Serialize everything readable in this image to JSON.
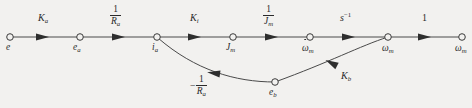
{
  "figure": {
    "type": "signal-flow-graph",
    "title": "",
    "background_color": "#f2f1ef",
    "line_color": "#3a3a3a"
  },
  "nodes": [
    {
      "id": "e",
      "label": "e",
      "sub": "",
      "dot": false,
      "x": 10,
      "y": 37,
      "label_x": 6,
      "label_y": 47
    },
    {
      "id": "e_a",
      "label": "e",
      "sub": "a",
      "dot": false,
      "x": 80,
      "y": 37,
      "label_x": 74,
      "label_y": 47
    },
    {
      "id": "i_a",
      "label": "i",
      "sub": "a",
      "dot": false,
      "x": 157,
      "y": 37,
      "label_x": 153,
      "label_y": 47
    },
    {
      "id": "J_m",
      "label": "J",
      "sub": "m",
      "dot": false,
      "x": 233,
      "y": 37,
      "label_x": 227,
      "label_y": 47
    },
    {
      "id": "wdot_m",
      "label": "ω",
      "sub": "m",
      "dot": true,
      "x": 310,
      "y": 37,
      "label_x": 303,
      "label_y": 47
    },
    {
      "id": "w_m_mid",
      "label": "ω",
      "sub": "m",
      "dot": false,
      "x": 388,
      "y": 37,
      "label_x": 383,
      "label_y": 48
    },
    {
      "id": "w_m_out",
      "label": "ω",
      "sub": "m",
      "dot": false,
      "x": 462,
      "y": 37,
      "label_x": 456,
      "label_y": 48
    },
    {
      "id": "e_b",
      "label": "e",
      "sub": "b",
      "dot": false,
      "x": 275,
      "y": 82,
      "label_x": 270,
      "label_y": 93
    }
  ],
  "branches": [
    {
      "id": "branch-e-to-ea",
      "from": "e",
      "to": "e_a",
      "gain_kind": "plain",
      "gain": "K",
      "gain_sub": "a",
      "gain_x": 40,
      "gain_y": 12,
      "arrow_x": 42,
      "arrow_y": 37
    },
    {
      "id": "branch-ea-to-ia",
      "from": "e_a",
      "to": "i_a",
      "gain_kind": "fraction",
      "numerator": "1",
      "denominator": "R",
      "denominator_sub": "a",
      "gain_x": 113,
      "gain_y": 5,
      "arrow_x": 118,
      "arrow_y": 37
    },
    {
      "id": "branch-ia-to-Jm",
      "from": "i_a",
      "to": "J_m",
      "gain_kind": "plain",
      "gain": "K",
      "gain_sub": "i",
      "gain_x": 192,
      "gain_y": 12,
      "arrow_x": 194,
      "arrow_y": 37
    },
    {
      "id": "branch-Jm-to-wdot",
      "from": "J_m",
      "to": "wdot_m",
      "gain_kind": "fraction",
      "numerator": "1",
      "denominator": "J",
      "denominator_sub": "m",
      "gain_x": 266,
      "gain_y": 5,
      "arrow_x": 271,
      "arrow_y": 37
    },
    {
      "id": "branch-wdot-to-wm",
      "from": "wdot_m",
      "to": "w_m_mid",
      "gain_kind": "power",
      "gain": "s",
      "gain_sup": "−1",
      "gain_x": 342,
      "gain_y": 12,
      "arrow_x": 348,
      "arrow_y": 37
    },
    {
      "id": "branch-wm-to-out",
      "from": "w_m_mid",
      "to": "w_m_out",
      "gain_kind": "constant",
      "gain": "1",
      "gain_x": 424,
      "gain_y": 12,
      "arrow_x": 424,
      "arrow_y": 37
    },
    {
      "id": "branch-wm-to-eb",
      "from": "w_m_mid",
      "to": "e_b",
      "gain_kind": "plain",
      "gain": "K",
      "gain_sub": "b",
      "gain_x": 343,
      "gain_y": 70,
      "arrow_x": 0,
      "arrow_y": 0,
      "feedback": true
    },
    {
      "id": "branch-eb-to-ia",
      "from": "e_b",
      "to": "i_a",
      "gain_kind": "negative-fraction",
      "sign": "−",
      "numerator": "1",
      "denominator": "R",
      "denominator_sub": "a",
      "gain_x": 197,
      "gain_y": 80,
      "arrow_x": 0,
      "arrow_y": 0,
      "feedback": true
    }
  ],
  "accessibility": {
    "description": "Signal flow graph of a DC motor: e → e_a → i_a → J_m → ω̇_m → ω_m → ω_m with feedback through e_b"
  }
}
